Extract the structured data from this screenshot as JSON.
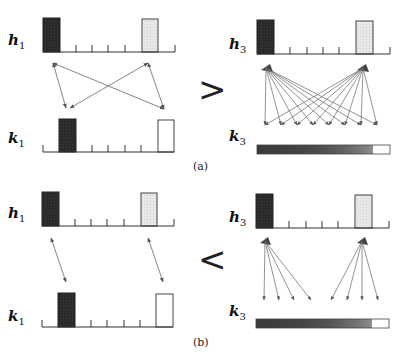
{
  "figure": {
    "panels": [
      {
        "id": "a",
        "caption": "(a)",
        "comparison_symbol": ">",
        "left": {
          "top_label": "h",
          "top_sub": "1",
          "bottom_label": "k",
          "bottom_sub": "1",
          "connection": "many-to-many (all pairs, 4 bidirectional arrows)"
        },
        "right": {
          "top_label": "h",
          "top_sub": "3",
          "bottom_label": "k",
          "bottom_sub": "3",
          "connection": "each source spreads to all 8 targets"
        }
      },
      {
        "id": "b",
        "caption": "(b)",
        "comparison_symbol": "<",
        "left": {
          "top_label": "h",
          "top_sub": "1",
          "bottom_label": "k",
          "bottom_sub": "1",
          "connection": "one-to-one (2 bidirectional arrows)"
        },
        "right": {
          "top_label": "h",
          "top_sub": "3",
          "bottom_label": "k",
          "bottom_sub": "3",
          "connection": "each source spreads to 4 nearby targets"
        }
      }
    ],
    "colors": {
      "dark_bar": "#2e2e2e",
      "light_bar": "#e4e4e4",
      "empty_bar": "#ffffff",
      "axis": "#333333",
      "arrow": "#666666",
      "gradient": [
        "#3a3a3a",
        "#444444",
        "#4e4e4e",
        "#5a5a5a",
        "#6a6a6a",
        "#7c7c7c",
        "#909090",
        "#ffffff"
      ]
    }
  }
}
